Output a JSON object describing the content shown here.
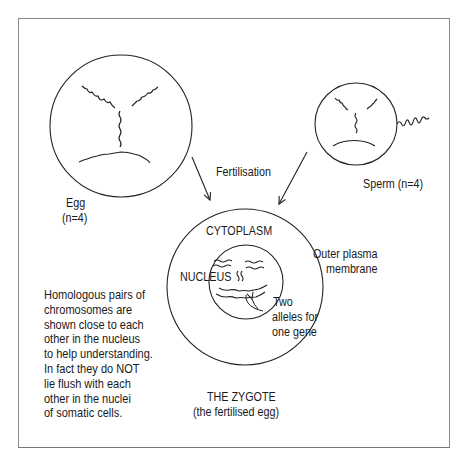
{
  "diagram": {
    "egg": {
      "label": "Egg",
      "count": "(n=4)"
    },
    "sperm": {
      "label": "Sperm (n=4)"
    },
    "process": {
      "label": "Fertilisation"
    },
    "zygote": {
      "cytoplasm_label": "CYTOPLASM",
      "nucleus_label": "NUCLEUS",
      "membrane_label_line1": "Outer plasma",
      "membrane_label_line2": "membrane",
      "alleles_line1": "Two",
      "alleles_line2": "alleles for",
      "alleles_line3": "one gene",
      "title": "THE ZYGOTE",
      "subtitle": "(the fertilised egg)"
    },
    "note": "Homologous pairs of\nchromosomes are\nshown close to each\nother in the nucleus\nto help understanding.\nIn fact they do NOT\nlie flush with each\nother in the nuclei\nof somatic cells.",
    "colors": {
      "line": "#222222",
      "frame": "#8a8a8a",
      "background": "#ffffff"
    }
  }
}
